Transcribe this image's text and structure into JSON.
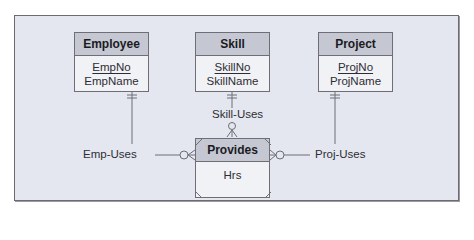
{
  "diagram": {
    "type": "entity-relationship",
    "entities": [
      {
        "id": "employee",
        "name": "Employee",
        "primary_key": "EmpNo",
        "attributes": [
          "EmpName"
        ]
      },
      {
        "id": "skill",
        "name": "Skill",
        "primary_key": "SkillNo",
        "attributes": [
          "SkillName"
        ]
      },
      {
        "id": "project",
        "name": "Project",
        "primary_key": "ProjNo",
        "attributes": [
          "ProjName"
        ]
      }
    ],
    "associative_entity": {
      "name": "Provides",
      "attributes": [
        "Hrs"
      ]
    },
    "relationships": [
      {
        "name": "Emp-Uses",
        "from": "Employee",
        "to": "Provides",
        "from_cardinality": "one-and-only-one",
        "to_cardinality": "zero-or-many"
      },
      {
        "name": "Skill-Uses",
        "from": "Skill",
        "to": "Provides",
        "from_cardinality": "one-and-only-one",
        "to_cardinality": "zero-or-many"
      },
      {
        "name": "Proj-Uses",
        "from": "Project",
        "to": "Provides",
        "from_cardinality": "one-and-only-one",
        "to_cardinality": "zero-or-many"
      }
    ],
    "colors": {
      "panel_bg": "#e4e7ef",
      "header_bg": "#c5c7d2",
      "body_bg": "#f1f2f6",
      "line": "#6e6e74"
    }
  }
}
